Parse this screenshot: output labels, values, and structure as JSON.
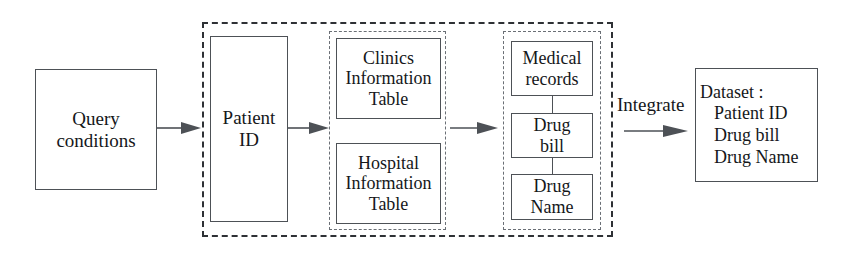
{
  "diagram": {
    "colors": {
      "stroke": "#4d5156",
      "dashed_outer": "#2e3135",
      "dashed_inner": "#6a6f75",
      "text": "#15171a",
      "background": "#ffffff"
    },
    "nodes": {
      "query_conditions": {
        "line1": "Query",
        "line2": "conditions"
      },
      "patient_id": {
        "line1": "Patient",
        "line2": "ID"
      },
      "clinics_information_table": {
        "line1": "Clinics",
        "line2": "Information",
        "line3": "Table"
      },
      "hospital_information_table": {
        "line1": "Hospital",
        "line2": "Information",
        "line3": "Table"
      },
      "medical_records": {
        "line1": "Medical",
        "line2": "records"
      },
      "drug_bill": {
        "line1": "Drug",
        "line2": "bill"
      },
      "drug_name": {
        "line1": "Drug",
        "line2": "Name"
      },
      "dataset": {
        "heading": "Dataset :",
        "items": [
          "Patient ID",
          "Drug bill",
          "Drug Name"
        ]
      }
    },
    "labels": {
      "integrate": "Integrate"
    },
    "edges": [
      {
        "name": "query-to-patient",
        "from": "query_conditions",
        "to": "patient_id",
        "style": "solid-arrow"
      },
      {
        "name": "patient-to-tables",
        "from": "patient_id",
        "to": "clinics_information_table",
        "style": "solid-arrow"
      },
      {
        "name": "tables-to-records",
        "from": "clinics_information_table",
        "to": "medical_records",
        "style": "solid-arrow"
      },
      {
        "name": "records-to-dataset",
        "from": "medical_records",
        "to": "dataset",
        "style": "solid-arrow",
        "label": "Integrate"
      },
      {
        "name": "medical-records-to-drug-bill",
        "from": "medical_records",
        "to": "drug_bill",
        "style": "plain-line"
      },
      {
        "name": "drug-bill-to-drug-name",
        "from": "drug_bill",
        "to": "drug_name",
        "style": "plain-line"
      }
    ],
    "groups": {
      "database_boundary": {
        "name": "database-boundary",
        "style": "dashed"
      },
      "information_tables_group": {
        "name": "information-tables-group",
        "style": "dashed"
      },
      "records_group": {
        "name": "records-group",
        "style": "dashed"
      }
    }
  }
}
